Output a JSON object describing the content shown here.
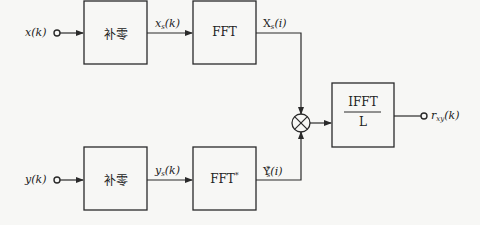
{
  "diagram": {
    "inputs": {
      "x": {
        "label": "x(k)",
        "name": "x",
        "arg": "(k)"
      },
      "y": {
        "label": "y(k)",
        "name": "y",
        "arg": "(k)"
      }
    },
    "blocks": {
      "pad_x": {
        "label": "补零"
      },
      "pad_y": {
        "label": "补零"
      },
      "fft": {
        "label": "FFT"
      },
      "fft_conj": {
        "label": "FFT",
        "sup": "*"
      },
      "ifft": {
        "numerator": "IFFT",
        "denominator": "L"
      }
    },
    "signals": {
      "xs_k": {
        "base": "x",
        "sub": "s",
        "arg": "(k)"
      },
      "ys_k": {
        "base": "y",
        "sub": "s",
        "arg": "(k)"
      },
      "Xs_i": {
        "base": "X",
        "sub": "s",
        "arg": "(i)"
      },
      "Ys_conj_i": {
        "base": "Y",
        "sub": "s",
        "sup": "*",
        "arg": "(i)"
      }
    },
    "multiplier": {
      "symbol": "⊗"
    },
    "output": {
      "base": "r",
      "sub": "xy",
      "arg": "(k)"
    },
    "colors": {
      "line": "#2a2a2a",
      "background": "#f7f7f5"
    }
  }
}
